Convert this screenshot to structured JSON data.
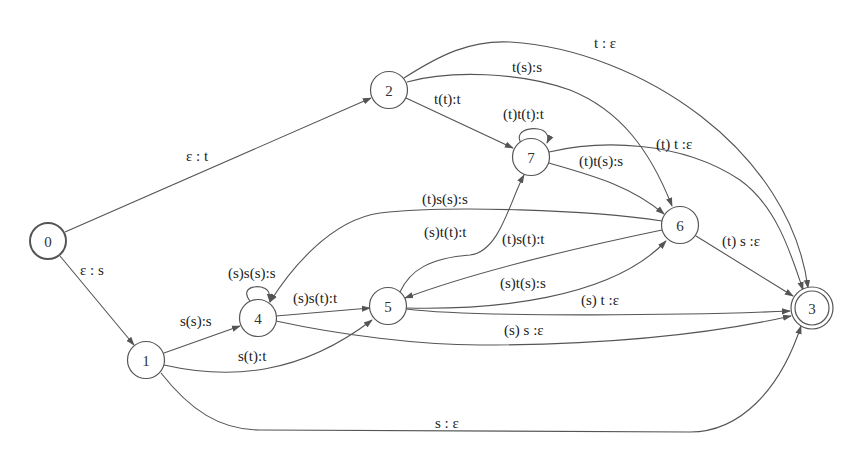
{
  "diagram": {
    "type": "finite-state-transducer",
    "nodes": [
      {
        "id": "0",
        "label": "0",
        "x": 48,
        "y": 241,
        "initial": true,
        "final": false
      },
      {
        "id": "1",
        "label": "1",
        "x": 146,
        "y": 360,
        "initial": false,
        "final": false
      },
      {
        "id": "2",
        "label": "2",
        "x": 389,
        "y": 90,
        "initial": false,
        "final": false
      },
      {
        "id": "3",
        "label": "3",
        "x": 812,
        "y": 308,
        "initial": false,
        "final": true
      },
      {
        "id": "4",
        "label": "4",
        "x": 258,
        "y": 318,
        "initial": false,
        "final": false
      },
      {
        "id": "5",
        "label": "5",
        "x": 388,
        "y": 306,
        "initial": false,
        "final": false
      },
      {
        "id": "6",
        "label": "6",
        "x": 680,
        "y": 225,
        "initial": false,
        "final": false
      },
      {
        "id": "7",
        "label": "7",
        "x": 531,
        "y": 157,
        "initial": false,
        "final": false
      }
    ],
    "edges": [
      {
        "from": "0",
        "to": "2",
        "label": "ε : t"
      },
      {
        "from": "0",
        "to": "1",
        "label": "ε : s"
      },
      {
        "from": "1",
        "to": "4",
        "label": "s(s):s"
      },
      {
        "from": "1",
        "to": "5",
        "label": "s(t):t"
      },
      {
        "from": "1",
        "to": "3",
        "label": "s : ε"
      },
      {
        "from": "2",
        "to": "3",
        "label": "t : ε"
      },
      {
        "from": "2",
        "to": "6",
        "label": "t(s):s"
      },
      {
        "from": "2",
        "to": "7",
        "label": "t(t):t"
      },
      {
        "from": "7",
        "to": "7",
        "label": "(t)t(t):t"
      },
      {
        "from": "7",
        "to": "3",
        "label": "(t) t :ε"
      },
      {
        "from": "7",
        "to": "6",
        "label": "(t)t(s):s"
      },
      {
        "from": "6",
        "to": "4",
        "label": "(t)s(s):s"
      },
      {
        "from": "6",
        "to": "5",
        "label": "(t)s(t):t"
      },
      {
        "from": "6",
        "to": "3",
        "label": "(t) s :ε"
      },
      {
        "from": "5",
        "to": "7",
        "label": "(s)t(t):t"
      },
      {
        "from": "5",
        "to": "6",
        "label": "(s)t(s):s"
      },
      {
        "from": "5",
        "to": "3",
        "label": "(s) t :ε"
      },
      {
        "from": "4",
        "to": "4",
        "label": "(s)s(s):s"
      },
      {
        "from": "4",
        "to": "5",
        "label": "(s)s(t):t"
      },
      {
        "from": "4",
        "to": "3",
        "label": "(s) s :ε"
      }
    ]
  }
}
